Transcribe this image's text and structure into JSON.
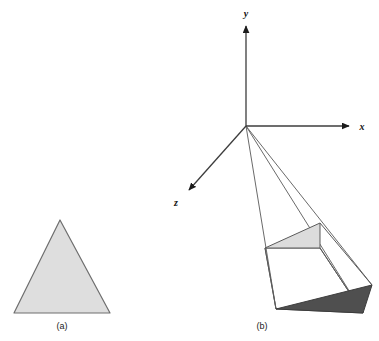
{
  "figure": {
    "background_color": "#ffffff",
    "panels": [
      {
        "id": "panel-a",
        "caption": "(a)",
        "caption_pos": {
          "x": 62,
          "y": 329
        },
        "description": "filled triangle",
        "triangle": {
          "points": "60,220 110,313 14,313",
          "fill": "#dedede",
          "stroke": "#6e6e6e",
          "stroke_width": 1.2
        }
      },
      {
        "id": "panel-b",
        "caption": "(b)",
        "caption_pos": {
          "x": 262,
          "y": 329
        },
        "description": "perspective projection frustum with near and far triangles"
      }
    ],
    "axes": {
      "origin": {
        "x": 246,
        "y": 126
      },
      "stroke": "#3d3d3d",
      "stroke_width": 1.3,
      "items": [
        {
          "name": "y-axis",
          "label": "y",
          "end": {
            "x": 246,
            "y": 24
          },
          "label_pos": {
            "x": 246,
            "y": 16
          }
        },
        {
          "name": "x-axis",
          "label": "x",
          "end": {
            "x": 351,
            "y": 126
          },
          "label_pos": {
            "x": 362,
            "y": 129
          }
        },
        {
          "name": "z-axis",
          "label": "z",
          "end": {
            "x": 187,
            "y": 192
          },
          "label_pos": {
            "x": 176,
            "y": 205
          }
        }
      ]
    },
    "colors": {
      "near_triangle_fill": "#dcdcdc",
      "far_triangle_fill": "#4f4f4f",
      "edge_stroke": "#5a5a5a",
      "ray_stroke": "#6a6a6a",
      "panel_a_fill": "#dedede",
      "panel_a_stroke": "#6e6e6e",
      "axis_stroke": "#3d3d3d",
      "text_color": "#1a1a1a"
    },
    "near_triangle": {
      "name": "near-plane-triangle",
      "points": "265,248 320,223 320,248",
      "fill": "#dcdcdc",
      "stroke": "#5a5a5a"
    },
    "far_triangle": {
      "name": "far-plane-triangle",
      "points": "276,309 372,285 363,313",
      "fill": "#4f4f4f",
      "stroke": "#404040"
    },
    "frustum_edges": [
      {
        "name": "edge-left-apex-to-near",
        "from": {
          "x": 265,
          "y": 248
        },
        "to": {
          "x": 276,
          "y": 309
        }
      },
      {
        "name": "edge-top-near-to-far",
        "from": {
          "x": 320,
          "y": 223
        },
        "to": {
          "x": 372,
          "y": 285
        }
      },
      {
        "name": "edge-bottom-near-to-far",
        "from": {
          "x": 320,
          "y": 248
        },
        "to": {
          "x": 363,
          "y": 313
        }
      },
      {
        "name": "edge-far-back-left",
        "from": {
          "x": 265,
          "y": 248
        },
        "to": {
          "x": 320,
          "y": 248
        }
      }
    ],
    "projection_rays": [
      {
        "name": "ray-to-left-vertex",
        "from": {
          "x": 246,
          "y": 126
        },
        "to": {
          "x": 276,
          "y": 309
        }
      },
      {
        "name": "ray-to-top-vertex",
        "from": {
          "x": 246,
          "y": 126
        },
        "to": {
          "x": 372,
          "y": 285
        }
      },
      {
        "name": "ray-to-bottom-vertex",
        "from": {
          "x": 246,
          "y": 126
        },
        "to": {
          "x": 363,
          "y": 313
        }
      }
    ],
    "side_quad": {
      "name": "frustum-side-face",
      "points": "265,248 320,248 363,313 276,309",
      "fill": "#ffffff",
      "stroke": "#5a5a5a"
    }
  },
  "labels": {
    "panel_a_caption": "(a)",
    "panel_b_caption": "(b)",
    "axis_y": "y",
    "axis_x": "x",
    "axis_z": "z"
  }
}
